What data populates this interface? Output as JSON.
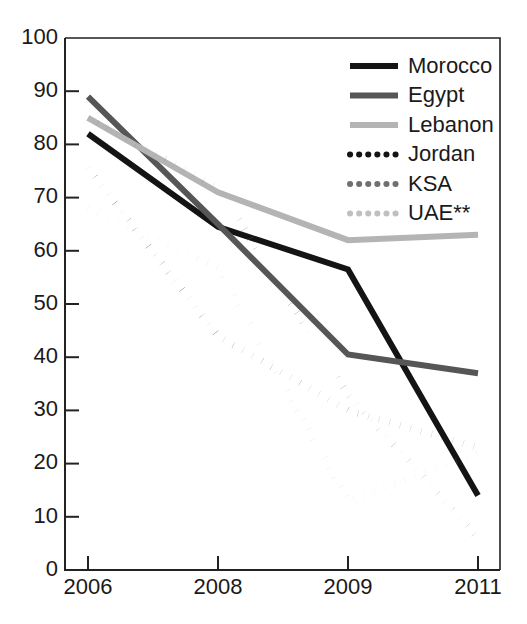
{
  "chart_data": {
    "type": "line",
    "title": "",
    "xlabel": "",
    "ylabel": "",
    "x": [
      "2006",
      "2008",
      "2009",
      "2011"
    ],
    "xtick_labels": [
      "2006",
      "2008",
      "2009",
      "2011"
    ],
    "ytick_labels": [
      "0",
      "10",
      "20",
      "30",
      "40",
      "50",
      "60",
      "70",
      "80",
      "90",
      "100"
    ],
    "yticks": [
      0,
      10,
      20,
      30,
      40,
      50,
      60,
      70,
      80,
      90,
      100
    ],
    "ylim": [
      0,
      100
    ],
    "grid": false,
    "legend_position": "top-right",
    "series": [
      {
        "name": "Morocco",
        "values": [
          82,
          64.5,
          56.5,
          14
        ],
        "style": "solid",
        "color": "#141414",
        "width": 6
      },
      {
        "name": "Egypt",
        "values": [
          89,
          65,
          40.5,
          37
        ],
        "style": "solid",
        "color": "#565656",
        "width": 6
      },
      {
        "name": "Lebanon",
        "values": [
          85,
          71,
          62,
          63
        ],
        "style": "solid",
        "color": "#b4b4b4",
        "width": 6
      },
      {
        "name": "Jordan",
        "values": [
          75.5,
          44,
          30,
          23
        ],
        "style": "dotted",
        "color": "#141414",
        "width": 7
      },
      {
        "name": "KSA",
        "values": [
          85,
          72,
          33,
          6
        ],
        "style": "dotted",
        "color": "#707070",
        "width": 7
      },
      {
        "name": "UAE**",
        "values": [
          68,
          57,
          13,
          22
        ],
        "style": "dotted",
        "color": "#c0c0c0",
        "width": 7
      }
    ]
  },
  "legend": {
    "items": [
      {
        "label": "Morocco"
      },
      {
        "label": "Egypt"
      },
      {
        "label": "Lebanon"
      },
      {
        "label": "Jordan"
      },
      {
        "label": "KSA"
      },
      {
        "label": "UAE**"
      }
    ]
  },
  "axes": {
    "y_labels": [
      "100",
      "90",
      "80",
      "70",
      "60",
      "50",
      "40",
      "30",
      "20",
      "10",
      "0"
    ],
    "x_labels": [
      "2006",
      "2008",
      "2009",
      "2011"
    ]
  },
  "colors": {
    "axis": "#222222",
    "text": "#1a1a1a",
    "background": "#ffffff"
  }
}
